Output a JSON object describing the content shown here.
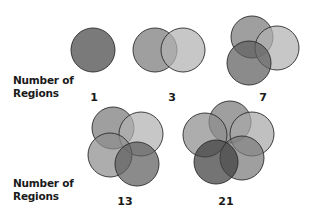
{
  "labels": {
    "row1_line1": "Number of",
    "row1_line2": "Regions",
    "row2_line1": "Number of",
    "row2_line2": "Regions"
  },
  "diagrams": [
    {
      "regions": "1",
      "label_x": 94,
      "label_y": 92,
      "circles": [
        {
          "cx": 93,
          "cy": 50,
          "r": 22,
          "fill": "#7a7a7a"
        }
      ]
    },
    {
      "regions": "3",
      "label_x": 172,
      "label_y": 92,
      "circles": [
        {
          "cx": 155,
          "cy": 50,
          "r": 22,
          "fill": "#7a7a7a"
        },
        {
          "cx": 183,
          "cy": 50,
          "r": 22,
          "fill": "#b2b2b2"
        }
      ]
    },
    {
      "regions": "7",
      "label_x": 263,
      "label_y": 92,
      "circles": [
        {
          "cx": 252,
          "cy": 37,
          "r": 21,
          "fill": "#7a7a7a"
        },
        {
          "cx": 277,
          "cy": 48,
          "r": 22,
          "fill": "#b2b2b2"
        },
        {
          "cx": 249,
          "cy": 63,
          "r": 22,
          "fill": "#5e5e5e"
        }
      ]
    },
    {
      "regions": "13",
      "label_x": 125,
      "label_y": 196,
      "circles": [
        {
          "cx": 113,
          "cy": 128,
          "r": 21,
          "fill": "#7a7a7a"
        },
        {
          "cx": 141,
          "cy": 134,
          "r": 22,
          "fill": "#b2b2b2"
        },
        {
          "cx": 110,
          "cy": 155,
          "r": 22,
          "fill": "#8e8e8e"
        },
        {
          "cx": 137,
          "cy": 164,
          "r": 22,
          "fill": "#5e5e5e"
        }
      ]
    },
    {
      "regions": "21",
      "label_x": 226,
      "label_y": 196,
      "circles": [
        {
          "cx": 230,
          "cy": 122,
          "r": 21,
          "fill": "#7a7a7a"
        },
        {
          "cx": 252,
          "cy": 134,
          "r": 22,
          "fill": "#a8a8a8"
        },
        {
          "cx": 205,
          "cy": 135,
          "r": 22,
          "fill": "#8e8e8e"
        },
        {
          "cx": 242,
          "cy": 158,
          "r": 22,
          "fill": "#7a7a7a"
        },
        {
          "cx": 216,
          "cy": 162,
          "r": 22,
          "fill": "#3e3e3e"
        }
      ]
    }
  ],
  "style": {
    "stroke": "#2a2a2a",
    "opacity": 0.72
  }
}
